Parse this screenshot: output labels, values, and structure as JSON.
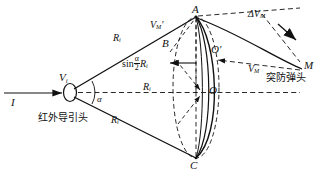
{
  "figure": {
    "type": "technical-diagram",
    "width": 328,
    "height": 179,
    "line_color": "#111111",
    "background": "#ffffff"
  },
  "labels": {
    "incident_ray": "I",
    "seeker_velocity": "V",
    "seeker_velocity_sub": "i",
    "seeker_caption": "红外导引头",
    "half_angle": "α",
    "range_upper": "R",
    "range_upper_sub": "i",
    "range_axis": "R",
    "range_axis_sub": "i",
    "range_lower": "R",
    "range_lower_sub": "i",
    "radius_expr_prefix": "sin",
    "radius_expr_num": "α",
    "radius_expr_den": "2",
    "radius_expr_tail": "R",
    "radius_expr_tail_sub": "i",
    "point_A": "A",
    "point_B": "B",
    "point_C": "C",
    "point_O": "O",
    "point_O_prime": "O′",
    "point_M": "M",
    "missile_velocity_prime": "V",
    "missile_velocity_prime_sub": "M",
    "missile_velocity_prime_mark": "′",
    "missile_velocity": "V",
    "missile_velocity_sub": "M",
    "delta_velocity_symbol": "ΔV",
    "delta_velocity_sub": "M",
    "warhead_caption": "突防弹头"
  },
  "geometry": {
    "seeker_point": [
      71,
      93
    ],
    "apex_A": [
      196,
      17
    ],
    "apex_C": [
      196,
      158
    ],
    "center_O": [
      205,
      92
    ],
    "point_O_prime": [
      213,
      56
    ],
    "point_B": [
      170,
      48
    ],
    "point_M": [
      304,
      70
    ],
    "axis_y": 92
  }
}
